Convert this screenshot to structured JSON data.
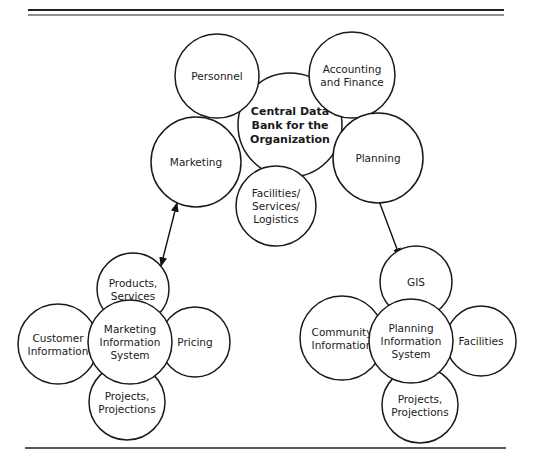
{
  "diagram": {
    "type": "bubble-cluster",
    "colors": {
      "stroke": "#1a1a1a",
      "fill": "#ffffff",
      "background": "#ffffff"
    },
    "central_cluster": {
      "hub": {
        "id": "central",
        "lines": [
          "Central Data",
          "Bank for the",
          "Organization"
        ],
        "cx": 290,
        "cy": 125,
        "r": 52
      },
      "satellites": [
        {
          "id": "personnel",
          "lines": [
            "Personnel"
          ],
          "cx": 217,
          "cy": 76,
          "r": 42
        },
        {
          "id": "accounting",
          "lines": [
            "Accounting",
            "and Finance"
          ],
          "cx": 352,
          "cy": 75,
          "r": 43
        },
        {
          "id": "marketing",
          "lines": [
            "Marketing"
          ],
          "cx": 196,
          "cy": 162,
          "r": 45
        },
        {
          "id": "planning",
          "lines": [
            "Planning"
          ],
          "cx": 378,
          "cy": 158,
          "r": 45
        },
        {
          "id": "facilities-services-logistics",
          "lines": [
            "Facilities/",
            "Services/",
            "Logistics"
          ],
          "cx": 276,
          "cy": 206,
          "r": 40
        }
      ]
    },
    "marketing_cluster": {
      "hub": {
        "id": "marketing-information-system",
        "lines": [
          "Marketing",
          "Information",
          "System"
        ],
        "cx": 130,
        "cy": 342,
        "r": 42
      },
      "satellites": [
        {
          "id": "products-services",
          "lines": [
            "Products,",
            "Services"
          ],
          "cx": 133,
          "cy": 289,
          "r": 36
        },
        {
          "id": "customer-information",
          "lines": [
            "Customer",
            "Information"
          ],
          "cx": 58,
          "cy": 344,
          "r": 40
        },
        {
          "id": "pricing",
          "lines": [
            "Pricing"
          ],
          "cx": 195,
          "cy": 342,
          "r": 35
        },
        {
          "id": "projects-projections-marketing",
          "lines": [
            "Projects,",
            "Projections"
          ],
          "cx": 127,
          "cy": 402,
          "r": 38
        }
      ]
    },
    "planning_cluster": {
      "hub": {
        "id": "planning-information-system",
        "lines": [
          "Planning",
          "Information",
          "System"
        ],
        "cx": 411,
        "cy": 341,
        "r": 42
      },
      "satellites": [
        {
          "id": "gis",
          "lines": [
            "GIS"
          ],
          "cx": 416,
          "cy": 282,
          "r": 36
        },
        {
          "id": "community-information",
          "lines": [
            "Community",
            "Information"
          ],
          "cx": 342,
          "cy": 338,
          "r": 42
        },
        {
          "id": "facilities",
          "lines": [
            "Facilities"
          ],
          "cx": 481,
          "cy": 341,
          "r": 35
        },
        {
          "id": "projects-projections-planning",
          "lines": [
            "Projects,",
            "Projections"
          ],
          "cx": 420,
          "cy": 405,
          "r": 38
        }
      ]
    },
    "connections": [
      {
        "from": "marketing",
        "to": "products-services",
        "style": "double-arrow",
        "x1": 177,
        "y1": 203,
        "x2": 161,
        "y2": 266
      },
      {
        "from": "planning",
        "to": "gis",
        "style": "double-arrow",
        "x1": 376,
        "y1": 193,
        "x2": 400,
        "y2": 257
      }
    ],
    "rules": {
      "top_thick": {
        "x1": 28,
        "x2": 504,
        "y": 10,
        "width": 2.2
      },
      "top_thin": {
        "x1": 28,
        "x2": 504,
        "y": 15,
        "width": 1
      },
      "bottom": {
        "x1": 25,
        "x2": 506,
        "y": 448,
        "width": 1.6
      }
    }
  }
}
